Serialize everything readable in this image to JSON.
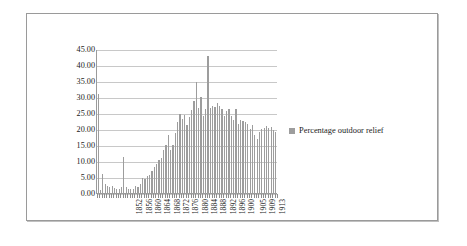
{
  "chart_data": {
    "type": "bar",
    "title": "",
    "xlabel": "",
    "ylabel": "",
    "ylim": [
      0,
      45
    ],
    "ytick_step": 5,
    "grid": true,
    "legend_position": "right",
    "series_name": "Percentage outdoor relief",
    "bar_color": "#9d9d9d",
    "ytick_labels": [
      "45.00",
      "40.00",
      "35.00",
      "30.00",
      "25.00",
      "20.00",
      "15.00",
      "10.00",
      "5.00",
      "0.00"
    ],
    "ytick_values": [
      45,
      40,
      35,
      30,
      25,
      20,
      15,
      10,
      5,
      0
    ],
    "xtick_labels": [
      "1852",
      "1856",
      "1860",
      "1864",
      "1868",
      "1872",
      "1876",
      "1880",
      "1884",
      "1888",
      "1892",
      "1896",
      "1900",
      "1905",
      "1909",
      "1913"
    ],
    "categories": [
      "1837",
      "1838",
      "1839",
      "1840",
      "1841",
      "1842",
      "1843",
      "1844",
      "1845",
      "1846",
      "1847",
      "1848",
      "1849",
      "1850",
      "1851",
      "1852",
      "1853",
      "1854",
      "1855",
      "1856",
      "1857",
      "1858",
      "1859",
      "1860",
      "1861",
      "1862",
      "1863",
      "1864",
      "1865",
      "1866",
      "1867",
      "1868",
      "1869",
      "1870",
      "1871",
      "1872",
      "1873",
      "1874",
      "1875",
      "1876",
      "1877",
      "1878",
      "1879",
      "1880",
      "1881",
      "1882",
      "1883",
      "1884",
      "1885",
      "1886",
      "1887",
      "1888",
      "1889",
      "1890",
      "1891",
      "1892",
      "1893",
      "1894",
      "1895",
      "1896",
      "1897",
      "1898",
      "1899",
      "1900",
      "1901",
      "1902",
      "1903",
      "1904",
      "1905",
      "1906",
      "1907",
      "1908",
      "1909",
      "1910",
      "1911",
      "1912",
      "1913"
    ],
    "values": [
      31.2,
      1.1,
      6.3,
      3.1,
      2.6,
      2.2,
      2.6,
      2.0,
      1.6,
      1.5,
      2.1,
      11.5,
      2.2,
      1.7,
      1.6,
      1.7,
      2.4,
      2.3,
      3.1,
      5.1,
      4.6,
      5.6,
      6.0,
      7.3,
      8.3,
      9.4,
      10.5,
      11.4,
      13.9,
      15.4,
      18.3,
      13.6,
      15.3,
      19.0,
      22.5,
      25.0,
      23.5,
      24.8,
      21.5,
      24.0,
      26.1,
      29.0,
      35.0,
      27.0,
      30.2,
      24.4,
      26.5,
      43.1,
      26.8,
      27.4,
      27.2,
      28.3,
      27.6,
      26.5,
      24.5,
      25.8,
      26.6,
      24.4,
      23.2,
      26.5,
      22.0,
      23.1,
      22.8,
      22.6,
      21.8,
      20.3,
      21.5,
      18.4,
      17.2,
      19.5,
      20.2,
      20.7,
      21.1,
      20.5,
      21.0,
      20.1,
      19.4
    ]
  },
  "legend": {
    "label": "Percentage outdoor relief"
  }
}
